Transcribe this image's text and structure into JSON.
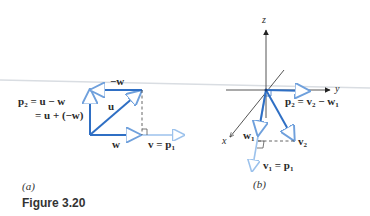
{
  "figure": {
    "caption": "Figure 3.20",
    "colors": {
      "vector_dark": "#2f6fc4",
      "vector_light": "#8fb8e8",
      "axis": "#3a3a3a",
      "dashed": "#555555",
      "text": "#2a2a2a"
    },
    "panel_a": {
      "label": "(a)",
      "vectors": [
        {
          "name": "u",
          "label": "u"
        },
        {
          "name": "w",
          "label": "w"
        },
        {
          "name": "neg_w",
          "label": "−w"
        },
        {
          "name": "v",
          "label": "v = p",
          "sub": "1"
        },
        {
          "name": "p2",
          "label": "p",
          "sub": "2"
        }
      ],
      "equation_line1": " = u − w",
      "equation_line2": "= u + (−w)"
    },
    "panel_b": {
      "label": "(b)",
      "axes": {
        "x": "x",
        "y": "y",
        "z": "z"
      },
      "labels": {
        "p2_main": "p",
        "p2_sub": "2",
        "p2_eq": " = v",
        "p2_eq_sub": "2",
        "p2_minus": " − w",
        "p2_minus_sub": "1",
        "w1_main": "w",
        "w1_sub": "1",
        "v2_main": "v",
        "v2_sub": "2",
        "v1_main": "v",
        "v1_sub": "1",
        "v1_eq": " = p",
        "v1_eq_sub": "1"
      }
    }
  }
}
